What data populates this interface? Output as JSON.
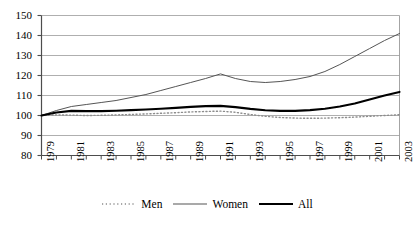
{
  "chart_data": {
    "type": "line",
    "title": "",
    "xlabel": "",
    "ylabel": "",
    "ylim": [
      80,
      150
    ],
    "yticks": [
      80,
      90,
      100,
      110,
      120,
      130,
      140,
      150
    ],
    "grid": true,
    "legend_position": "bottom-center",
    "x": [
      1979,
      1980,
      1981,
      1982,
      1983,
      1984,
      1985,
      1986,
      1987,
      1988,
      1989,
      1990,
      1991,
      1992,
      1993,
      1994,
      1995,
      1996,
      1997,
      1998,
      1999,
      2000,
      2001,
      2002,
      2003
    ],
    "xtick_labels": [
      "1979",
      "1981",
      "1983",
      "1985",
      "1987",
      "1989",
      "1991",
      "1993",
      "1995",
      "1997",
      "1999",
      "2001",
      "2003"
    ],
    "series": [
      {
        "name": "Men",
        "style": "dotted",
        "color": "#8c8c8c",
        "values": [
          100,
          100.3,
          100.2,
          100.0,
          100.1,
          100.3,
          100.5,
          100.8,
          101.1,
          101.4,
          101.8,
          102.0,
          102.2,
          101.6,
          100.5,
          99.6,
          99.0,
          98.7,
          98.6,
          98.7,
          98.9,
          99.2,
          99.6,
          100.0,
          100.4
        ]
      },
      {
        "name": "Women",
        "style": "solid-thin",
        "color": "#555555",
        "values": [
          100,
          102.5,
          104.5,
          105.5,
          106.5,
          107.5,
          109.0,
          110.5,
          112.5,
          114.5,
          116.5,
          118.5,
          120.8,
          118.5,
          117.0,
          116.5,
          117.0,
          118.0,
          119.5,
          122.0,
          125.5,
          129.5,
          133.5,
          137.5,
          141.0
        ]
      },
      {
        "name": "All",
        "style": "solid-thick",
        "color": "#000000",
        "values": [
          100,
          101.5,
          102.3,
          102.2,
          102.2,
          102.4,
          102.7,
          103.0,
          103.4,
          103.8,
          104.3,
          104.7,
          104.8,
          104.2,
          103.3,
          102.6,
          102.3,
          102.3,
          102.7,
          103.4,
          104.5,
          106.0,
          108.0,
          110.0,
          111.8
        ]
      }
    ]
  },
  "legend": {
    "items": [
      {
        "label": "Men"
      },
      {
        "label": "Women"
      },
      {
        "label": "All"
      }
    ]
  }
}
